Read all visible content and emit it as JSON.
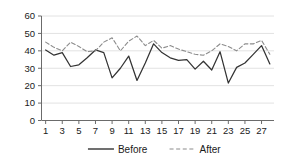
{
  "chart_data": {
    "type": "line",
    "title": "",
    "xlabel": "",
    "ylabel": "",
    "ylim": [
      0,
      60
    ],
    "y_ticks": [
      0,
      10,
      20,
      30,
      40,
      50,
      60
    ],
    "x": [
      1,
      2,
      3,
      4,
      5,
      6,
      7,
      8,
      9,
      10,
      11,
      12,
      13,
      14,
      15,
      16,
      17,
      18,
      19,
      20,
      21,
      22,
      23,
      24,
      25,
      26,
      27,
      28
    ],
    "x_tick_labels": [
      "1",
      "3",
      "5",
      "7",
      "9",
      "11",
      "13",
      "15",
      "17",
      "19",
      "21",
      "23",
      "25",
      "27"
    ],
    "grid": true,
    "legend_position": "bottom",
    "series": [
      {
        "name": "Before",
        "style": "solid",
        "color": "#333333",
        "values": [
          40.5,
          37.5,
          39,
          31,
          32,
          36,
          40.5,
          39,
          24.5,
          30,
          37,
          23,
          33,
          44,
          39,
          36,
          34.5,
          35,
          29.5,
          34,
          29,
          39.5,
          21.5,
          30.5,
          33,
          38,
          43,
          32.5
        ]
      },
      {
        "name": "After",
        "style": "dashed",
        "color": "#8c8c8c",
        "values": [
          45,
          42,
          40,
          45,
          42.5,
          39.5,
          40,
          45,
          47.5,
          40,
          45.5,
          48.5,
          43,
          46,
          41.5,
          43,
          41,
          39.5,
          38,
          37.5,
          40,
          44,
          42.5,
          40,
          44,
          44,
          46,
          38
        ]
      }
    ]
  },
  "legend": {
    "items": [
      {
        "label": "Before",
        "style": "solid",
        "color": "#333333"
      },
      {
        "label": "After",
        "style": "dashed",
        "color": "#8c8c8c"
      }
    ]
  }
}
